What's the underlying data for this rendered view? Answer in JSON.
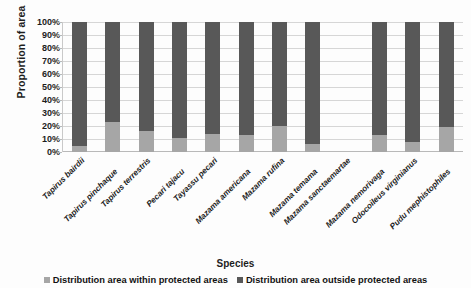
{
  "chart_data": {
    "type": "bar",
    "stacked": true,
    "stack_mode": "100-percent",
    "title": "",
    "xlabel": "Species",
    "ylabel": "Proportion of area",
    "ylim": [
      0,
      100
    ],
    "ytick_labels": [
      "100%",
      "90%",
      "80%",
      "70%",
      "60%",
      "50%",
      "40%",
      "30%",
      "20%",
      "10%",
      "0%"
    ],
    "ytick_values": [
      100,
      90,
      80,
      70,
      60,
      50,
      40,
      30,
      20,
      10,
      0
    ],
    "grid": true,
    "legend_position": "bottom",
    "categories": [
      "Tapirus bairdii",
      "Tapirus pinchaque",
      "Tapirus terrestris",
      "Pecari tajacu",
      "Tayassu pecari",
      "Mazama americana",
      "Mazama rufina",
      "Mazama temama",
      "Mazama sanctaemartae",
      "Mazama nemorivaga",
      "Odocoileus virginianus",
      "Pudu mephistophiles"
    ],
    "series": [
      {
        "name": "Distribution area within protected areas",
        "color": "#a6a6a6",
        "values": [
          5,
          23,
          16,
          11,
          14,
          13,
          20,
          6,
          null,
          13,
          8,
          19
        ]
      },
      {
        "name": "Distribution area outside protected areas",
        "color": "#585858",
        "values": [
          95,
          77,
          84,
          89,
          86,
          87,
          80,
          94,
          null,
          87,
          92,
          81
        ]
      }
    ]
  },
  "legend": {
    "items": [
      {
        "label": "Distribution area within protected areas",
        "swatch": "within"
      },
      {
        "label": "Distribution area outside protected areas",
        "swatch": "outside"
      }
    ]
  },
  "colors": {
    "within": "#a6a6a6",
    "outside": "#585858",
    "gridline": "#d6d6d6",
    "text": "#1d1d1d",
    "background": "#fdfdfd"
  }
}
